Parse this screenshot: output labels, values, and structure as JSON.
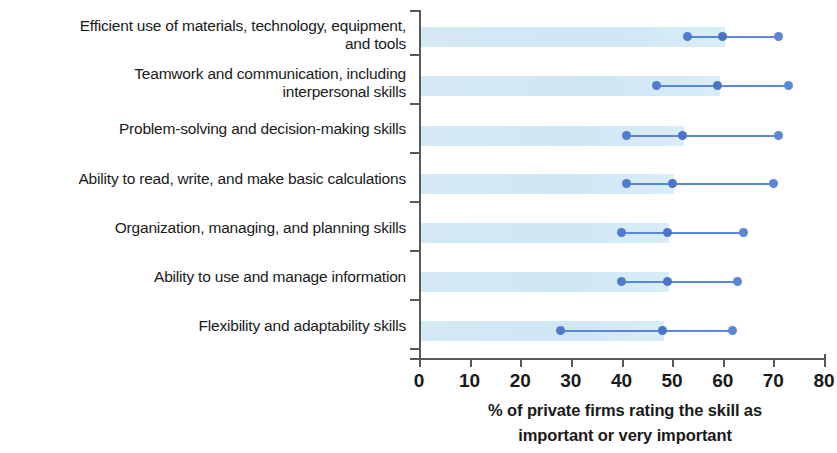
{
  "chart_data": {
    "type": "bar",
    "title": "",
    "subtitle": "",
    "xlabel": "% of private firms rating the skill as important or very important",
    "ylabel": "",
    "xlim": [
      0,
      80
    ],
    "ylim": null,
    "grid": false,
    "legend": null,
    "axis": {
      "x_ticks": [
        0,
        10,
        20,
        30,
        40,
        50,
        60,
        70,
        80
      ],
      "x_tick_labels": [
        "0",
        "10",
        "20",
        "30",
        "40",
        "50",
        "60",
        "70",
        "80"
      ]
    },
    "caption_line_1": "% of private firms rating the skill as",
    "caption_line_2": "important or very important",
    "categories": [
      "Efficient use of materials, technology, equipment, and tools",
      "Teamwork and communication, including interpersonal skills",
      "Problem-solving and decision-making skills",
      "Ability to read, write, and make basic calculations",
      "Organization, managing, and planning skills",
      "Ability to use and manage information",
      "Flexibility and adaptability skills"
    ],
    "category_lines": [
      [
        "Efficient use of materials, technology, equipment,",
        "and tools"
      ],
      [
        "Teamwork and communication, including",
        "interpersonal skills"
      ],
      [
        "Problem-solving and decision-making skills"
      ],
      [
        "Ability to read, write, and make basic calculations"
      ],
      [
        "Organization, managing, and planning skills"
      ],
      [
        "Ability to use and manage information"
      ],
      [
        "Flexibility and adaptability skills"
      ]
    ],
    "series": [
      {
        "name": "low marker",
        "values": [
          53,
          47,
          41,
          41,
          40,
          40,
          28
        ]
      },
      {
        "name": "mid marker",
        "values": [
          60,
          59,
          52,
          50,
          49,
          49,
          48
        ]
      },
      {
        "name": "high marker",
        "values": [
          71,
          73,
          71,
          70,
          64,
          63,
          62
        ]
      }
    ],
    "bar_values": [
      60,
      59,
      52,
      50,
      49,
      49,
      48
    ],
    "colors": {
      "band": "#cfe6f3",
      "marker": "#5b86d6",
      "connector": "#5b87d8",
      "axis": "#555a5e",
      "text": "#1a1a1a"
    }
  }
}
